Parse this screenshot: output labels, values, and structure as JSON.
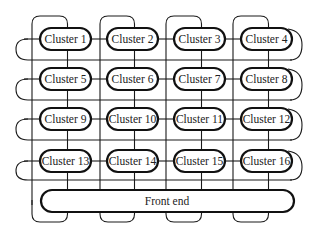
{
  "diagram": {
    "type": "cluster interconnect topology",
    "clusters": [
      {
        "id": 1,
        "label": "Cluster 1",
        "row": 0,
        "col": 0
      },
      {
        "id": 2,
        "label": "Cluster 2",
        "row": 0,
        "col": 1
      },
      {
        "id": 3,
        "label": "Cluster 3",
        "row": 0,
        "col": 2
      },
      {
        "id": 4,
        "label": "Cluster 4",
        "row": 0,
        "col": 3
      },
      {
        "id": 5,
        "label": "Cluster 5",
        "row": 1,
        "col": 0
      },
      {
        "id": 6,
        "label": "Cluster 6",
        "row": 1,
        "col": 1
      },
      {
        "id": 7,
        "label": "Cluster 7",
        "row": 1,
        "col": 2
      },
      {
        "id": 8,
        "label": "Cluster 8",
        "row": 1,
        "col": 3
      },
      {
        "id": 9,
        "label": "Cluster 9",
        "row": 2,
        "col": 0
      },
      {
        "id": 10,
        "label": "Cluster 10",
        "row": 2,
        "col": 1
      },
      {
        "id": 11,
        "label": "Cluster 11",
        "row": 2,
        "col": 2
      },
      {
        "id": 12,
        "label": "Cluster 12",
        "row": 2,
        "col": 3
      },
      {
        "id": 13,
        "label": "Cluster 13",
        "row": 3,
        "col": 0
      },
      {
        "id": 14,
        "label": "Cluster 14",
        "row": 3,
        "col": 1
      },
      {
        "id": 15,
        "label": "Cluster 15",
        "row": 3,
        "col": 2
      },
      {
        "id": 16,
        "label": "Cluster 16",
        "row": 3,
        "col": 3
      }
    ],
    "front_end": {
      "label": "Front end"
    },
    "colors": {
      "stroke": "#111111",
      "background": "#ffffff",
      "text": "#222222"
    }
  }
}
